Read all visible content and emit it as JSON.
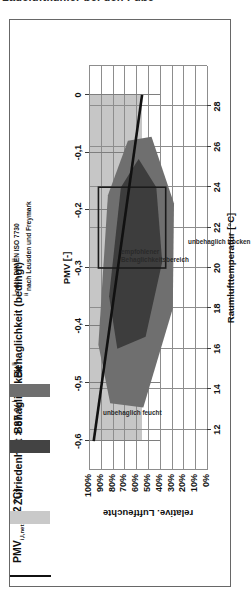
{
  "page": {
    "cropped_heading": "Ladeluftkühler bei den Füße"
  },
  "legend": {
    "items": [
      {
        "name": "pmv-line",
        "label_main": "PMV",
        "label_sub": "i,l,net",
        "label_tail": " (22 °C)",
        "swatch": "line",
        "color": "#111111"
      },
      {
        "name": "zufriedenheit",
        "label_main": "Zufriedenheit > 87 %",
        "label_sub": "",
        "label_tail": "",
        "footnote": "i",
        "swatch": "fill",
        "color": "#c9c9c9"
      },
      {
        "name": "behaglichkeit",
        "label_main": "Behaglichkeit",
        "label_sub": "",
        "label_tail": "",
        "footnote": "ii",
        "swatch": "fill",
        "color": "#434343"
      },
      {
        "name": "behaglichkeit-bedingt",
        "label_main": "Behaglichkeit (bedingt)",
        "label_sub": "",
        "label_tail": "",
        "footnote": "ii",
        "swatch": "fill",
        "color": "#6f6f6f"
      }
    ],
    "footnotes": [
      {
        "marker": "i",
        "text": "nach DIN EN ISO 7730"
      },
      {
        "marker": "ii",
        "text": "nach Leusden und Freymark"
      }
    ]
  },
  "chart_data": {
    "type": "scatter",
    "title": "",
    "xlabel": "Raumlufttemperatur [°C]",
    "ylabel": "relative. Luftfeuchte",
    "x2label": "PMV [-]",
    "xlim": [
      10,
      30
    ],
    "ylim": [
      0,
      100
    ],
    "xticks": [
      12,
      14,
      16,
      18,
      20,
      22,
      24,
      26,
      28
    ],
    "xticklabels": [
      "12",
      "14",
      "16",
      "18",
      "20",
      "22",
      "24",
      "26",
      "28"
    ],
    "yticks": [
      0,
      10,
      20,
      30,
      40,
      50,
      60,
      70,
      80,
      90,
      100
    ],
    "yticklabels": [
      "0%",
      "10%",
      "20%",
      "30%",
      "40%",
      "50%",
      "60%",
      "70%",
      "80%",
      "90%",
      "100%"
    ],
    "x2lim": [
      -0.65,
      0.05
    ],
    "x2ticks": [
      -0.6,
      -0.5,
      -0.4,
      -0.3,
      -0.2,
      -0.1,
      0
    ],
    "x2ticklabels": [
      "-0,6",
      "-0,5",
      "-0,4",
      "-0,3",
      "-0,2",
      "-0,1",
      "0"
    ],
    "grid": true,
    "legend_position": "right",
    "annotations": [
      {
        "name": "unbehaglich-feucht",
        "text": "unbehaglich feucht",
        "x": 13.0,
        "y": 88
      },
      {
        "name": "unbehaglich-trocken",
        "text": "unbehaglich trocken",
        "x": 21.5,
        "y": 16
      },
      {
        "name": "empfohlener-bereich",
        "text_line1": "empfohlener",
        "text_line2": "Behaglichkeitsbereich",
        "x": 21.0,
        "y": 73
      }
    ],
    "series": [
      {
        "name": "PMV (22 °C)",
        "type": "line",
        "axis": "x2",
        "color": "#111111",
        "points": [
          [
            -0.6,
            96
          ],
          [
            0.0,
            55
          ]
        ]
      },
      {
        "name": "Zufriedenheit > 87 %",
        "type": "band",
        "color": "#c6c6c6",
        "x_range": [
          -0.6,
          0.0
        ],
        "y_range": [
          55,
          100
        ]
      },
      {
        "name": "Behaglichkeit (bedingt)",
        "type": "polygon",
        "color": "#6f6f6f",
        "vertices": [
          [
            13.3,
            82
          ],
          [
            16.2,
            92
          ],
          [
            23.6,
            84
          ],
          [
            26.3,
            67
          ],
          [
            26.5,
            47
          ],
          [
            23.2,
            28
          ],
          [
            18.0,
            29
          ],
          [
            13.1,
            54
          ]
        ]
      },
      {
        "name": "Behaglichkeit",
        "type": "polygon",
        "color": "#3d3d3d",
        "vertices": [
          [
            16.0,
            76
          ],
          [
            18.6,
            83
          ],
          [
            24.0,
            73
          ],
          [
            25.4,
            58
          ],
          [
            24.0,
            43
          ],
          [
            20.3,
            38
          ],
          [
            16.6,
            52
          ]
        ]
      },
      {
        "name": "empfohlener Behaglichkeitsbereich",
        "type": "rect-outline",
        "color": "#1b1b1b",
        "x_range": [
          20.0,
          24.0
        ],
        "y_range": [
          35,
          92
        ]
      }
    ]
  }
}
